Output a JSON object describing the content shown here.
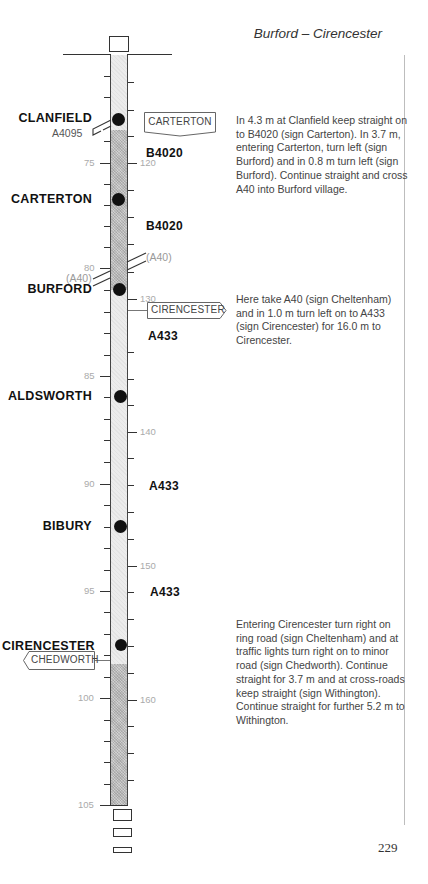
{
  "header": {
    "title": "Burford – Cirencester"
  },
  "page_number": "229",
  "route": {
    "towns": [
      {
        "name": "CLANFIELD",
        "mile_y": 119
      },
      {
        "name": "CARTERTON",
        "mile_y": 199
      },
      {
        "name": "BURFORD",
        "mile_y": 289
      },
      {
        "name": "ALDSWORTH",
        "mile_y": 396
      },
      {
        "name": "BIBURY",
        "mile_y": 526
      },
      {
        "name": "CIRENCESTER",
        "mile_y": 646
      }
    ],
    "road_labels": [
      {
        "label": "A4095",
        "side": "left"
      },
      {
        "label": "B4020",
        "side": "right"
      },
      {
        "label": "B4020",
        "side": "right"
      },
      {
        "label": "(A40)",
        "side": "right"
      },
      {
        "label": "(A40)",
        "side": "left"
      },
      {
        "label": "A433",
        "side": "right"
      },
      {
        "label": "A433",
        "side": "right"
      },
      {
        "label": "A433",
        "side": "right"
      }
    ],
    "signs": [
      {
        "label": "CARTERTON",
        "direction": "down"
      },
      {
        "label": "CIRENCESTER",
        "direction": "right"
      },
      {
        "label": "CHEDWORTH",
        "direction": "left"
      }
    ],
    "mile_ticks": [
      "75",
      "80",
      "85",
      "90",
      "95",
      "100",
      "105"
    ],
    "km_ticks": [
      "120",
      "130",
      "140",
      "150",
      "160"
    ]
  },
  "directions": [
    {
      "text": "In 4.3 m at Clanfield keep straight on to B4020 (sign Carterton). In 3.7 m, entering Carterton, turn left (sign Burford) and in 0.8 m turn left (sign Burford). Continue straight and cross A40 into Burford village."
    },
    {
      "text": "Here take A40 (sign Cheltenham) and in 1.0 m turn left on to A433 (sign Cirencester) for 16.0 m to Cirencester."
    },
    {
      "text": "Entering Cirencester turn right on ring road (sign Cheltenham) and at traffic lights turn right on to minor road (sign Chedworth). Continue straight for 3.7 m and at cross-roads keep straight (sign Withington). Continue straight for further 5.2 m to Withington."
    }
  ]
}
